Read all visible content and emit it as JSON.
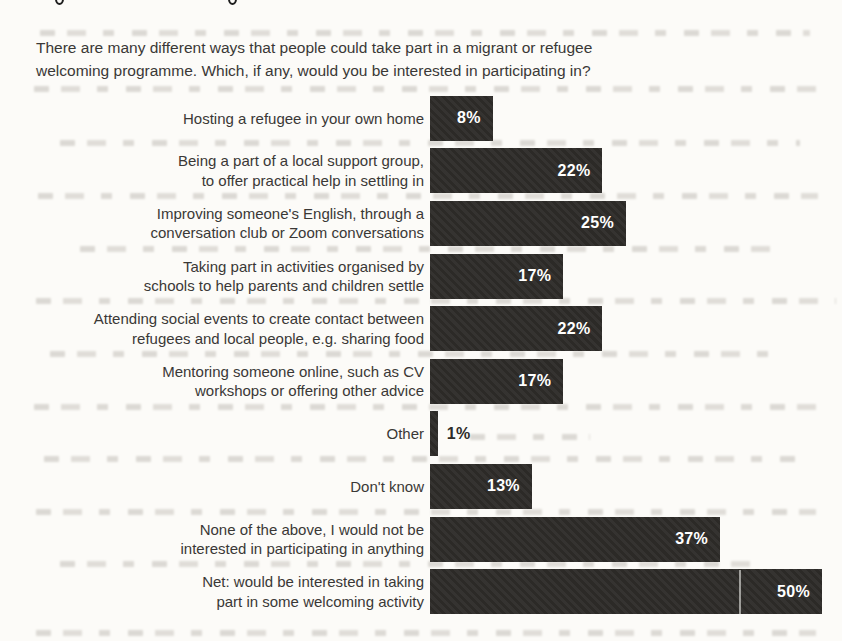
{
  "figure": {
    "question": "There are many different ways that people could take part in a migrant or refugee\nwelcoming programme. Which, if any, would you be interested in participating in?"
  },
  "chart_data": {
    "type": "bar",
    "orientation": "horizontal",
    "title": "There are many different ways that people could take part in a migrant or refugee welcoming programme. Which, if any, would you be interested in participating in?",
    "categories": [
      "Hosting a refugee in your own home",
      "Being a part of a local support group,\nto offer practical help in settling in",
      "Improving someone's English, through a\nconversation club or Zoom conversations",
      "Taking part in activities organised by\nschools to help parents and children settle",
      "Attending social events to create contact between\nrefugees and local people, e.g. sharing food",
      "Mentoring someone online, such as CV\nworkshops or offering other advice",
      "Other",
      "Don't know",
      "None of the above, I would not be\ninterested in participating in anything",
      "Net: would be interested in taking\npart in some welcoming activity"
    ],
    "values": [
      8,
      22,
      25,
      17,
      22,
      17,
      1,
      13,
      37,
      50
    ],
    "value_labels": [
      "8%",
      "22%",
      "25%",
      "17%",
      "22%",
      "17%",
      "1%",
      "13%",
      "37%",
      "50%"
    ],
    "unit": "%",
    "xlabel": "",
    "ylabel": "",
    "xlim": [
      0,
      50
    ],
    "grid": false,
    "legend": "none",
    "axis_ticks": "none",
    "bar_color": "#2e2c29",
    "value_label_color_inside": "#ffffff",
    "value_label_color_outside": "#2e2c29",
    "background_color": "#fcfbf8",
    "text_color": "#3a3836"
  }
}
